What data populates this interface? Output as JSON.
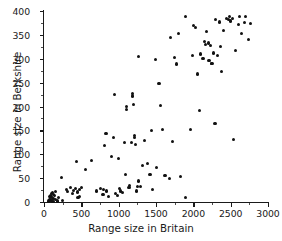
{
  "chart_data": {
    "type": "scatter",
    "title": "",
    "xlabel": "Range size in Britain",
    "ylabel": "Range size in Berkshire",
    "xlim": [
      0,
      3000
    ],
    "ylim": [
      0,
      400
    ],
    "xticks": [
      0,
      500,
      1000,
      1500,
      2000,
      2500,
      3000
    ],
    "yticks": [
      0,
      50,
      100,
      150,
      200,
      250,
      300,
      350,
      400
    ],
    "xtick_labels": [
      "0",
      "500",
      "1000",
      "1500",
      "2000",
      "2500",
      "3000"
    ],
    "ytick_labels": [
      "0",
      "50",
      "100",
      "150",
      "200",
      "250",
      "300",
      "350",
      "400"
    ],
    "x_minor_tick_interval": 250,
    "y_minor_tick_interval": 25,
    "grid": false,
    "legend": false,
    "legend_position": "none",
    "marker": "filled-circle",
    "marker_color": "#111111",
    "marker_size": 3,
    "axis_color": "#1a1a1a",
    "background_color": "#ffffff",
    "n_points": 120,
    "annotations": [],
    "points": [
      [
        60,
        2
      ],
      [
        70,
        6
      ],
      [
        75,
        11
      ],
      [
        80,
        4
      ],
      [
        85,
        14
      ],
      [
        90,
        9
      ],
      [
        95,
        18
      ],
      [
        100,
        3
      ],
      [
        105,
        12
      ],
      [
        110,
        7
      ],
      [
        115,
        20
      ],
      [
        120,
        1
      ],
      [
        125,
        16
      ],
      [
        130,
        8
      ],
      [
        140,
        13
      ],
      [
        150,
        5
      ],
      [
        160,
        22
      ],
      [
        175,
        2
      ],
      [
        195,
        10
      ],
      [
        240,
        51
      ],
      [
        250,
        4
      ],
      [
        300,
        26
      ],
      [
        320,
        22
      ],
      [
        360,
        30
      ],
      [
        380,
        18
      ],
      [
        395,
        24
      ],
      [
        420,
        28
      ],
      [
        440,
        84
      ],
      [
        450,
        21
      ],
      [
        455,
        9
      ],
      [
        470,
        26
      ],
      [
        480,
        12
      ],
      [
        500,
        30
      ],
      [
        560,
        69
      ],
      [
        640,
        86
      ],
      [
        700,
        23
      ],
      [
        760,
        29
      ],
      [
        790,
        15
      ],
      [
        800,
        27
      ],
      [
        810,
        118
      ],
      [
        830,
        144
      ],
      [
        840,
        23
      ],
      [
        860,
        12
      ],
      [
        900,
        95
      ],
      [
        930,
        136
      ],
      [
        950,
        226
      ],
      [
        960,
        17
      ],
      [
        980,
        14
      ],
      [
        1000,
        92
      ],
      [
        1010,
        28
      ],
      [
        1030,
        23
      ],
      [
        1050,
        20
      ],
      [
        1080,
        125
      ],
      [
        1090,
        58
      ],
      [
        1100,
        194
      ],
      [
        1110,
        200
      ],
      [
        1130,
        30
      ],
      [
        1140,
        31
      ],
      [
        1150,
        35
      ],
      [
        1170,
        124
      ],
      [
        1180,
        222
      ],
      [
        1190,
        227
      ],
      [
        1200,
        205
      ],
      [
        1210,
        140
      ],
      [
        1215,
        136
      ],
      [
        1230,
        121
      ],
      [
        1240,
        23
      ],
      [
        1250,
        33
      ],
      [
        1260,
        304
      ],
      [
        1270,
        44
      ],
      [
        1290,
        32
      ],
      [
        1320,
        76
      ],
      [
        1350,
        128
      ],
      [
        1390,
        81
      ],
      [
        1420,
        57
      ],
      [
        1440,
        150
      ],
      [
        1450,
        27
      ],
      [
        1490,
        299
      ],
      [
        1510,
        72
      ],
      [
        1540,
        248
      ],
      [
        1560,
        202
      ],
      [
        1590,
        152
      ],
      [
        1620,
        55
      ],
      [
        1680,
        49
      ],
      [
        1700,
        345
      ],
      [
        1720,
        127
      ],
      [
        1750,
        302
      ],
      [
        1780,
        289
      ],
      [
        1800,
        352
      ],
      [
        1830,
        53
      ],
      [
        1890,
        10
      ],
      [
        1900,
        388
      ],
      [
        1960,
        152
      ],
      [
        1990,
        307
      ],
      [
        2000,
        369
      ],
      [
        2030,
        366
      ],
      [
        2050,
        268
      ],
      [
        2080,
        192
      ],
      [
        2100,
        310
      ],
      [
        2130,
        300
      ],
      [
        2150,
        337
      ],
      [
        2160,
        329
      ],
      [
        2180,
        358
      ],
      [
        2200,
        333
      ],
      [
        2210,
        296
      ],
      [
        2230,
        328
      ],
      [
        2240,
        291
      ],
      [
        2250,
        290
      ],
      [
        2270,
        312
      ],
      [
        2290,
        165
      ],
      [
        2300,
        383
      ],
      [
        2320,
        306
      ],
      [
        2350,
        377
      ],
      [
        2360,
        326
      ],
      [
        2380,
        273
      ],
      [
        2400,
        360
      ],
      [
        2450,
        384
      ],
      [
        2470,
        383
      ],
      [
        2490,
        389
      ],
      [
        2500,
        379
      ],
      [
        2520,
        385
      ],
      [
        2540,
        131
      ],
      [
        2560,
        318
      ],
      [
        2600,
        371
      ],
      [
        2620,
        388
      ],
      [
        2650,
        352
      ],
      [
        2680,
        376
      ],
      [
        2700,
        389
      ],
      [
        2740,
        340
      ],
      [
        2760,
        373
      ]
    ]
  }
}
